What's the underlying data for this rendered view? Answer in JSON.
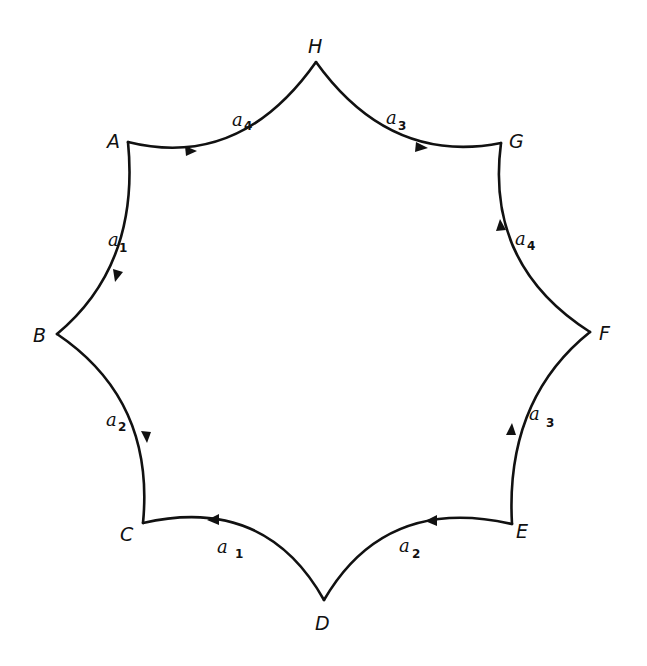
{
  "diagram": {
    "type": "fundamental-polygon",
    "colors": {
      "stroke": "#111111",
      "background": "#ffffff"
    },
    "vertices": [
      {
        "id": "H",
        "label": "H",
        "x": 316,
        "y": 62
      },
      {
        "id": "G",
        "label": "G",
        "x": 501,
        "y": 143
      },
      {
        "id": "F",
        "label": "F",
        "x": 590,
        "y": 332
      },
      {
        "id": "E",
        "label": "E",
        "x": 512,
        "y": 524
      },
      {
        "id": "D",
        "label": "D",
        "x": 324,
        "y": 600
      },
      {
        "id": "C",
        "label": "C",
        "x": 143,
        "y": 523
      },
      {
        "id": "B",
        "label": "B",
        "x": 57,
        "y": 334
      },
      {
        "id": "A",
        "label": "A",
        "x": 128,
        "y": 142
      }
    ],
    "edges": [
      {
        "from": "A",
        "to": "H",
        "label": "a",
        "subscript": "4",
        "arrow_direction": "A→H"
      },
      {
        "from": "H",
        "to": "G",
        "label": "a",
        "subscript": "3",
        "arrow_direction": "H→G"
      },
      {
        "from": "G",
        "to": "F",
        "label": "a",
        "subscript": "4",
        "arrow_direction": "F→G"
      },
      {
        "from": "F",
        "to": "E",
        "label": "a",
        "subscript": "3",
        "arrow_direction": "E→F"
      },
      {
        "from": "E",
        "to": "D",
        "label": "a",
        "subscript": "2",
        "arrow_direction": "D→E"
      },
      {
        "from": "D",
        "to": "C",
        "label": "a",
        "subscript": "1",
        "arrow_direction": "D→C"
      },
      {
        "from": "C",
        "to": "B",
        "label": "a",
        "subscript": "2",
        "arrow_direction": "B→C"
      },
      {
        "from": "B",
        "to": "A",
        "label": "a",
        "subscript": "1",
        "arrow_direction": "A→B"
      }
    ]
  }
}
